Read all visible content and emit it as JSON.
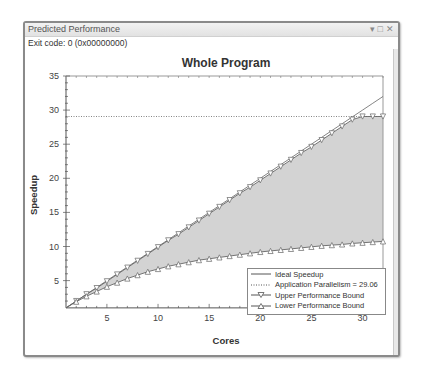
{
  "window": {
    "title": "Predicted Performance",
    "controls": {
      "dropdown": "▾",
      "maximize": "□",
      "close": "✕"
    },
    "exit_code": "Exit code: 0 (0x00000000)"
  },
  "colors": {
    "fill": "#d3d3d3",
    "line": "#666666",
    "frame": "#8a8a8a"
  },
  "chart_data": {
    "type": "line",
    "title": "Whole Program",
    "xlabel": "Cores",
    "ylabel": "Speedup",
    "xlim": [
      1,
      32
    ],
    "ylim": [
      1,
      35
    ],
    "xticks": [
      5,
      10,
      15,
      20,
      25,
      30
    ],
    "yticks": [
      5,
      10,
      15,
      20,
      25,
      30,
      35
    ],
    "grid": false,
    "legend_position": "lower right",
    "x": [
      1,
      2,
      3,
      4,
      5,
      6,
      7,
      8,
      9,
      10,
      11,
      12,
      13,
      14,
      15,
      16,
      17,
      18,
      19,
      20,
      21,
      22,
      23,
      24,
      25,
      26,
      27,
      28,
      29,
      30,
      31,
      32
    ],
    "series": [
      {
        "name": "Ideal Speedup",
        "style": "solid",
        "values": [
          1,
          2,
          3,
          4,
          5,
          6,
          7,
          8,
          9,
          10,
          11,
          12,
          13,
          14,
          15,
          16,
          17,
          18,
          19,
          20,
          21,
          22,
          23,
          24,
          25,
          26,
          27,
          28,
          29,
          30,
          31,
          32
        ]
      },
      {
        "name": "Application Parallelism = 29.06",
        "style": "dotted",
        "constant": 29.06
      },
      {
        "name": "Upper Performance Bound",
        "style": "solid",
        "marker": "triangle-down",
        "values": [
          1,
          2,
          3,
          3.9,
          4.9,
          5.9,
          6.9,
          7.9,
          8.9,
          9.9,
          10.9,
          11.8,
          12.8,
          13.8,
          14.8,
          15.8,
          16.8,
          17.8,
          18.7,
          19.7,
          20.7,
          21.7,
          22.7,
          23.7,
          24.6,
          25.6,
          26.6,
          27.6,
          28.6,
          29.06,
          29.06,
          29.06
        ]
      },
      {
        "name": "Lower Performance Bound",
        "style": "solid",
        "marker": "triangle-up",
        "values": [
          1,
          1.9,
          2.7,
          3.4,
          4.1,
          4.7,
          5.3,
          5.8,
          6.3,
          6.7,
          7.1,
          7.4,
          7.7,
          8.0,
          8.2,
          8.4,
          8.6,
          8.8,
          9.0,
          9.2,
          9.35,
          9.5,
          9.65,
          9.8,
          9.95,
          10.1,
          10.2,
          10.3,
          10.45,
          10.55,
          10.65,
          10.75
        ]
      }
    ]
  }
}
